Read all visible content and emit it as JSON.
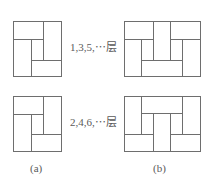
{
  "figure": {
    "row_labels": [
      "1,3,5,⋯层",
      "2,4,6,⋯层"
    ],
    "panel_labels": [
      "(a)",
      "(b)"
    ],
    "line_color": "#6e6e6e"
  }
}
